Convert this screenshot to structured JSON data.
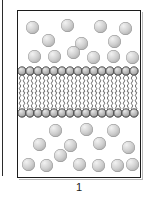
{
  "figure": {
    "caption": "1",
    "colors": {
      "background": "#ffffff",
      "box_border": "#1c1c1c",
      "box_shadow": "#b9b9b9",
      "page_edge_rule": "#2b2b2b",
      "solute_highlight": "#f2f2f2",
      "solute_midtone": "#cfcfcf",
      "solute_shadow": "#8e8e8e",
      "lipid_head_fill": "#a8a8a8",
      "lipid_head_highlight": "#e8e8e8",
      "lipid_head_outline": "#2a2a2a",
      "lipid_tail": "#3a3a3a",
      "caption_text": "#1a1a1a"
    },
    "geometry": {
      "box_left": 17,
      "box_top": 10,
      "box_width": 124,
      "box_height": 168,
      "membrane_top": 65,
      "membrane_height": 52,
      "solute_diameter": 13,
      "lipid_head_diameter": 8,
      "lipid_count_per_leaflet": 15
    }
  },
  "compartments": {
    "top": {
      "name": "upper-compartment",
      "solute_count": 13,
      "solutes": [
        {
          "x": 8,
          "y": 10
        },
        {
          "x": 43,
          "y": 8
        },
        {
          "x": 76,
          "y": 9
        },
        {
          "x": 101,
          "y": 11
        },
        {
          "x": 24,
          "y": 23
        },
        {
          "x": 57,
          "y": 26
        },
        {
          "x": 90,
          "y": 24
        },
        {
          "x": 10,
          "y": 39
        },
        {
          "x": 30,
          "y": 39
        },
        {
          "x": 49,
          "y": 35
        },
        {
          "x": 69,
          "y": 40
        },
        {
          "x": 89,
          "y": 39
        },
        {
          "x": 108,
          "y": 40
        }
      ]
    },
    "bottom": {
      "name": "lower-compartment",
      "solute_count": 14,
      "solutes": [
        {
          "x": 31,
          "y": 6
        },
        {
          "x": 62,
          "y": 5
        },
        {
          "x": 89,
          "y": 6
        },
        {
          "x": 15,
          "y": 20
        },
        {
          "x": 46,
          "y": 21
        },
        {
          "x": 75,
          "y": 19
        },
        {
          "x": 104,
          "y": 23
        },
        {
          "x": 36,
          "y": 31
        },
        {
          "x": 4,
          "y": 40
        },
        {
          "x": 22,
          "y": 41
        },
        {
          "x": 55,
          "y": 40
        },
        {
          "x": 74,
          "y": 41
        },
        {
          "x": 93,
          "y": 41
        },
        {
          "x": 108,
          "y": 40
        }
      ]
    }
  },
  "membrane": {
    "name": "phospholipid-bilayer",
    "leaflets": [
      "outer-leaflet",
      "inner-leaflet"
    ],
    "head_positions_x": [
      4,
      12,
      20,
      28,
      36,
      44,
      52,
      60,
      68,
      76,
      84,
      92,
      100,
      108,
      116
    ],
    "tail_positions_x": [
      2,
      6,
      10,
      14,
      18,
      22,
      26,
      30,
      34,
      38,
      42,
      46,
      50,
      54,
      58,
      62,
      66,
      70,
      74,
      78,
      82,
      86,
      90,
      94,
      98,
      102,
      106,
      110,
      114,
      118
    ],
    "outer_head_cy": 5,
    "inner_head_cy": 47,
    "head_radius": 4.2
  }
}
